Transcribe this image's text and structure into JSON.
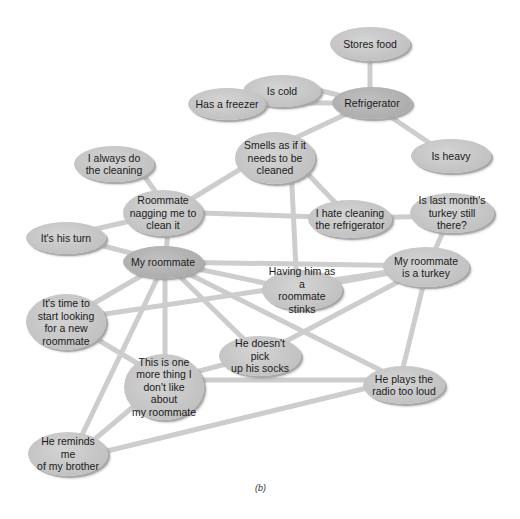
{
  "diagram": {
    "type": "concept-map / semantic network",
    "caption": "(b)",
    "colors": {
      "node_fill": "#c6c6c6",
      "central_node_fill": "#adadad",
      "edge": "#cdcdcd",
      "text": "#1a1a1a"
    },
    "nodes": [
      {
        "id": "stores_food",
        "label": "Stores food"
      },
      {
        "id": "is_cold",
        "label": "Is cold"
      },
      {
        "id": "has_freezer",
        "label": "Has a freezer"
      },
      {
        "id": "refrigerator",
        "label": "Refrigerator"
      },
      {
        "id": "smells",
        "label": "Smells as if it\nneeds to be\ncleaned"
      },
      {
        "id": "is_heavy",
        "label": "Is heavy"
      },
      {
        "id": "always_clean",
        "label": "I always do\nthe cleaning"
      },
      {
        "id": "nagging",
        "label": "Roommate\nnagging me to\nclean it"
      },
      {
        "id": "hate_cleaning",
        "label": "I hate cleaning\nthe refrigerator"
      },
      {
        "id": "turkey_q",
        "label": "Is last month's\nturkey still there?"
      },
      {
        "id": "his_turn",
        "label": "It's his turn"
      },
      {
        "id": "my_roommate",
        "label": "My roommate"
      },
      {
        "id": "roommate_turkey",
        "label": "My roommate\nis a turkey"
      },
      {
        "id": "having_him",
        "label": "Having him as a\nroommate stinks"
      },
      {
        "id": "new_roommate",
        "label": "It's time to\nstart looking\nfor a new\nroommate"
      },
      {
        "id": "socks",
        "label": "He doesn't pick\nup his socks"
      },
      {
        "id": "one_more",
        "label": "This is one\nmore thing I\ndon't like about\nmy roommate"
      },
      {
        "id": "radio",
        "label": "He plays the\nradio too loud"
      },
      {
        "id": "brother",
        "label": "He reminds me\nof my brother"
      }
    ],
    "edges": [
      [
        "refrigerator",
        "stores_food"
      ],
      [
        "refrigerator",
        "is_cold"
      ],
      [
        "refrigerator",
        "has_freezer"
      ],
      [
        "refrigerator",
        "is_heavy"
      ],
      [
        "refrigerator",
        "smells"
      ],
      [
        "refrigerator",
        "offscreen-right"
      ],
      [
        "smells",
        "nagging"
      ],
      [
        "smells",
        "hate_cleaning"
      ],
      [
        "smells",
        "having_him"
      ],
      [
        "nagging",
        "always_clean"
      ],
      [
        "nagging",
        "his_turn"
      ],
      [
        "nagging",
        "my_roommate"
      ],
      [
        "nagging",
        "hate_cleaning"
      ],
      [
        "hate_cleaning",
        "turkey_q"
      ],
      [
        "turkey_q",
        "roommate_turkey"
      ],
      [
        "my_roommate",
        "his_turn"
      ],
      [
        "my_roommate",
        "roommate_turkey"
      ],
      [
        "my_roommate",
        "having_him"
      ],
      [
        "my_roommate",
        "new_roommate"
      ],
      [
        "my_roommate",
        "socks"
      ],
      [
        "my_roommate",
        "one_more"
      ],
      [
        "my_roommate",
        "radio"
      ],
      [
        "my_roommate",
        "brother"
      ],
      [
        "roommate_turkey",
        "having_him"
      ],
      [
        "roommate_turkey",
        "socks"
      ],
      [
        "roommate_turkey",
        "radio"
      ],
      [
        "roommate_turkey",
        "new_roommate"
      ],
      [
        "new_roommate",
        "one_more"
      ],
      [
        "socks",
        "one_more"
      ],
      [
        "one_more",
        "radio"
      ],
      [
        "one_more",
        "brother"
      ],
      [
        "brother",
        "radio"
      ]
    ]
  }
}
